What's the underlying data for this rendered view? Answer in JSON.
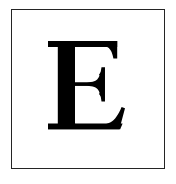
{
  "document": {
    "type": "glyph-specimen-card",
    "background_color": "#ffffff"
  },
  "card": {
    "name": "framed-glyph-card",
    "border_color": "#242424",
    "border_width_px": 1.6,
    "fill_color": "#ffffff",
    "bounds": {
      "left": 11,
      "top": 9,
      "width": 154,
      "height": 160
    }
  },
  "glyph": {
    "character": "E",
    "label": "letter-e",
    "style": "serif-capital",
    "color": "#000000",
    "bounds": {
      "left": 48,
      "top": 41,
      "right": 122,
      "bottom": 130
    },
    "cap_height_px": 89,
    "stem_width_px": 17,
    "top_arm_right_px": 117,
    "middle_arm_right_px": 102,
    "bottom_arm_right_px": 122
  },
  "palette": {
    "ink": "#000000",
    "frame": "#242424",
    "paper": "#ffffff"
  }
}
